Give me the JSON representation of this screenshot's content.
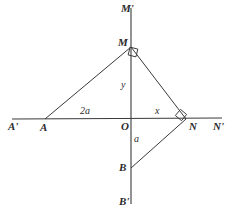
{
  "figure": {
    "type": "geometry-diagram",
    "background_color": "#ffffff",
    "line_color": "#3a3a3a",
    "label_color": "#2b2b2b"
  },
  "axes": {
    "vertical": {
      "top_label": "M'",
      "bottom_label": "B'",
      "origin_label": "O"
    },
    "horizontal": {
      "left_label": "A'",
      "right_label": "N'"
    }
  },
  "points": [
    {
      "name": "M-prime",
      "label": "M'",
      "x": 131,
      "y": 8,
      "label_x": 121,
      "label_y": 3
    },
    {
      "name": "M",
      "label": "M",
      "x": 131,
      "y": 47,
      "label_x": 118,
      "label_y": 37
    },
    {
      "name": "O",
      "label": "O",
      "x": 131,
      "y": 119,
      "label_x": 121,
      "label_y": 121
    },
    {
      "name": "B",
      "label": "B",
      "x": 131,
      "y": 168,
      "label_x": 119,
      "label_y": 162
    },
    {
      "name": "B-prime",
      "label": "B'",
      "x": 131,
      "y": 202,
      "label_x": 119,
      "label_y": 196
    },
    {
      "name": "A-prime",
      "label": "A'",
      "x": 14,
      "y": 119,
      "label_x": 8,
      "label_y": 121
    },
    {
      "name": "A",
      "label": "A",
      "x": 45,
      "y": 119,
      "label_x": 40,
      "label_y": 122
    },
    {
      "name": "N",
      "label": "N",
      "x": 185,
      "y": 118,
      "label_x": 189,
      "label_y": 121
    },
    {
      "name": "N-prime",
      "label": "N'",
      "x": 219,
      "y": 118,
      "label_x": 213,
      "label_y": 121
    }
  ],
  "segment_labels": [
    {
      "name": "segment-label-2a",
      "text": "2a",
      "x": 80,
      "y": 106
    },
    {
      "name": "segment-label-x",
      "text": "x",
      "x": 155,
      "y": 106
    },
    {
      "name": "segment-label-y",
      "text": "y",
      "x": 121,
      "y": 80
    },
    {
      "name": "segment-label-a",
      "text": "a",
      "x": 134,
      "y": 134
    }
  ],
  "right_angle_markers": [
    {
      "name": "right-angle-at-M",
      "at": "M",
      "x": 131,
      "y": 47
    },
    {
      "name": "right-angle-at-N",
      "at": "N",
      "x": 185,
      "y": 118
    }
  ],
  "segments": [
    {
      "name": "segment-AM",
      "from": "A",
      "to": "M"
    },
    {
      "name": "segment-MN",
      "from": "M",
      "to": "N"
    },
    {
      "name": "segment-NB",
      "from": "N",
      "to": "B"
    }
  ]
}
